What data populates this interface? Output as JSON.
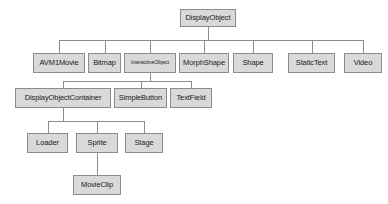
{
  "diagram": {
    "type": "class-hierarchy-tree",
    "colors": {
      "node_fill": "#d9d9d9",
      "node_border": "#8c8c8c",
      "edge": "#8c8c8c",
      "text": "#1a1a1a",
      "background": "#ffffff"
    },
    "nodes": [
      {
        "id": "DisplayObject",
        "label": "DisplayObject",
        "level": 0,
        "x": 180,
        "y": 9,
        "w": 56,
        "h": 18,
        "small": false
      },
      {
        "id": "AVM1Movie",
        "label": "AVM1Movie",
        "level": 1,
        "x": 33,
        "y": 53,
        "w": 52,
        "h": 20,
        "small": false
      },
      {
        "id": "Bitmap",
        "label": "Bitmap",
        "level": 1,
        "x": 88,
        "y": 53,
        "w": 33,
        "h": 20,
        "small": false
      },
      {
        "id": "InteractiveObject",
        "label": "InteractiveObject",
        "level": 1,
        "x": 124,
        "y": 53,
        "w": 52,
        "h": 20,
        "small": true
      },
      {
        "id": "MorphShape",
        "label": "MorphShape",
        "level": 1,
        "x": 179,
        "y": 53,
        "w": 50,
        "h": 20,
        "small": false
      },
      {
        "id": "Shape",
        "label": "Shape",
        "level": 1,
        "x": 233,
        "y": 53,
        "w": 40,
        "h": 20,
        "small": false
      },
      {
        "id": "StaticText",
        "label": "StaticText",
        "level": 1,
        "x": 288,
        "y": 53,
        "w": 47,
        "h": 20,
        "small": false
      },
      {
        "id": "Video",
        "label": "Video",
        "level": 1,
        "x": 344,
        "y": 53,
        "w": 38,
        "h": 20,
        "small": false
      },
      {
        "id": "DisplayObjectContainer",
        "label": "DisplayObjectContainer",
        "level": 2,
        "x": 15,
        "y": 88,
        "w": 96,
        "h": 20,
        "small": false
      },
      {
        "id": "SimpleButton",
        "label": "SimpleButton",
        "level": 2,
        "x": 114,
        "y": 88,
        "w": 53,
        "h": 20,
        "small": false
      },
      {
        "id": "TextField",
        "label": "TextField",
        "level": 2,
        "x": 170,
        "y": 88,
        "w": 42,
        "h": 20,
        "small": false
      },
      {
        "id": "Loader",
        "label": "Loader",
        "level": 3,
        "x": 27,
        "y": 133,
        "w": 41,
        "h": 20,
        "small": false
      },
      {
        "id": "Sprite",
        "label": "Sprite",
        "level": 3,
        "x": 76,
        "y": 133,
        "w": 42,
        "h": 20,
        "small": false
      },
      {
        "id": "Stage",
        "label": "Stage",
        "level": 3,
        "x": 125,
        "y": 133,
        "w": 38,
        "h": 20,
        "small": false
      },
      {
        "id": "MovieClip",
        "label": "MovieClip",
        "level": 4,
        "x": 73,
        "y": 175,
        "w": 48,
        "h": 20,
        "small": false
      }
    ],
    "edges": [
      {
        "from": "DisplayObject",
        "to": "AVM1Movie"
      },
      {
        "from": "DisplayObject",
        "to": "Bitmap"
      },
      {
        "from": "DisplayObject",
        "to": "InteractiveObject"
      },
      {
        "from": "DisplayObject",
        "to": "MorphShape"
      },
      {
        "from": "DisplayObject",
        "to": "Shape"
      },
      {
        "from": "DisplayObject",
        "to": "StaticText"
      },
      {
        "from": "DisplayObject",
        "to": "Video"
      },
      {
        "from": "InteractiveObject",
        "to": "DisplayObjectContainer"
      },
      {
        "from": "InteractiveObject",
        "to": "SimpleButton"
      },
      {
        "from": "InteractiveObject",
        "to": "TextField"
      },
      {
        "from": "DisplayObjectContainer",
        "to": "Loader"
      },
      {
        "from": "DisplayObjectContainer",
        "to": "Sprite"
      },
      {
        "from": "DisplayObjectContainer",
        "to": "Stage"
      },
      {
        "from": "Sprite",
        "to": "MovieClip"
      }
    ],
    "buses": [
      {
        "name": "root-bus",
        "x1": 59,
        "x2": 363,
        "y": 42,
        "parent_x": 208,
        "parent_bottom": 27,
        "child_top": 53
      },
      {
        "name": "interactive-object-bus",
        "x1": 63,
        "x2": 191,
        "y": 80,
        "parent_x": 150,
        "parent_bottom": 73,
        "child_top": 88
      },
      {
        "name": "display-object-container-bus",
        "x1": 47,
        "x2": 144,
        "y": 122,
        "parent_x": 63,
        "parent_bottom": 108,
        "child_top": 133
      },
      {
        "name": "sprite-movieclip-link",
        "x1": 97,
        "x2": 97,
        "y": 0,
        "parent_x": 97,
        "parent_bottom": 153,
        "child_top": 175
      }
    ]
  }
}
